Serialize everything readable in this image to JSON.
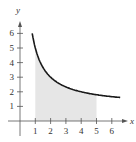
{
  "chart_data": {
    "type": "area",
    "title": "",
    "xlabel": "x",
    "ylabel": "y",
    "x_ticks": [
      "1",
      "2",
      "3",
      "4",
      "5",
      "6"
    ],
    "y_ticks": [
      "1",
      "2",
      "3",
      "4",
      "5",
      "6"
    ],
    "xlim": [
      -0.3,
      7
    ],
    "ylim": [
      -0.5,
      7
    ],
    "grid": false,
    "curve": {
      "description": "decreasing curve approx y = 1 + 4/x",
      "x": [
        0.8,
        1,
        1.5,
        2,
        2.5,
        3,
        3.5,
        4,
        4.5,
        5,
        5.5,
        6,
        6.5
      ],
      "y": [
        6.0,
        5.0,
        3.67,
        3.0,
        2.6,
        2.33,
        2.14,
        2.0,
        1.89,
        1.8,
        1.73,
        1.67,
        1.62
      ]
    },
    "shaded_region": {
      "x_from": 1,
      "x_to": 5,
      "color": "#e6e6e6"
    },
    "curve_color": "#1a1a1a"
  },
  "labels": {
    "x_axis": "x",
    "y_axis": "y",
    "x_ticks": [
      "1",
      "2",
      "3",
      "4",
      "5",
      "6"
    ],
    "y_ticks": [
      "1",
      "2",
      "3",
      "4",
      "5",
      "6"
    ]
  }
}
